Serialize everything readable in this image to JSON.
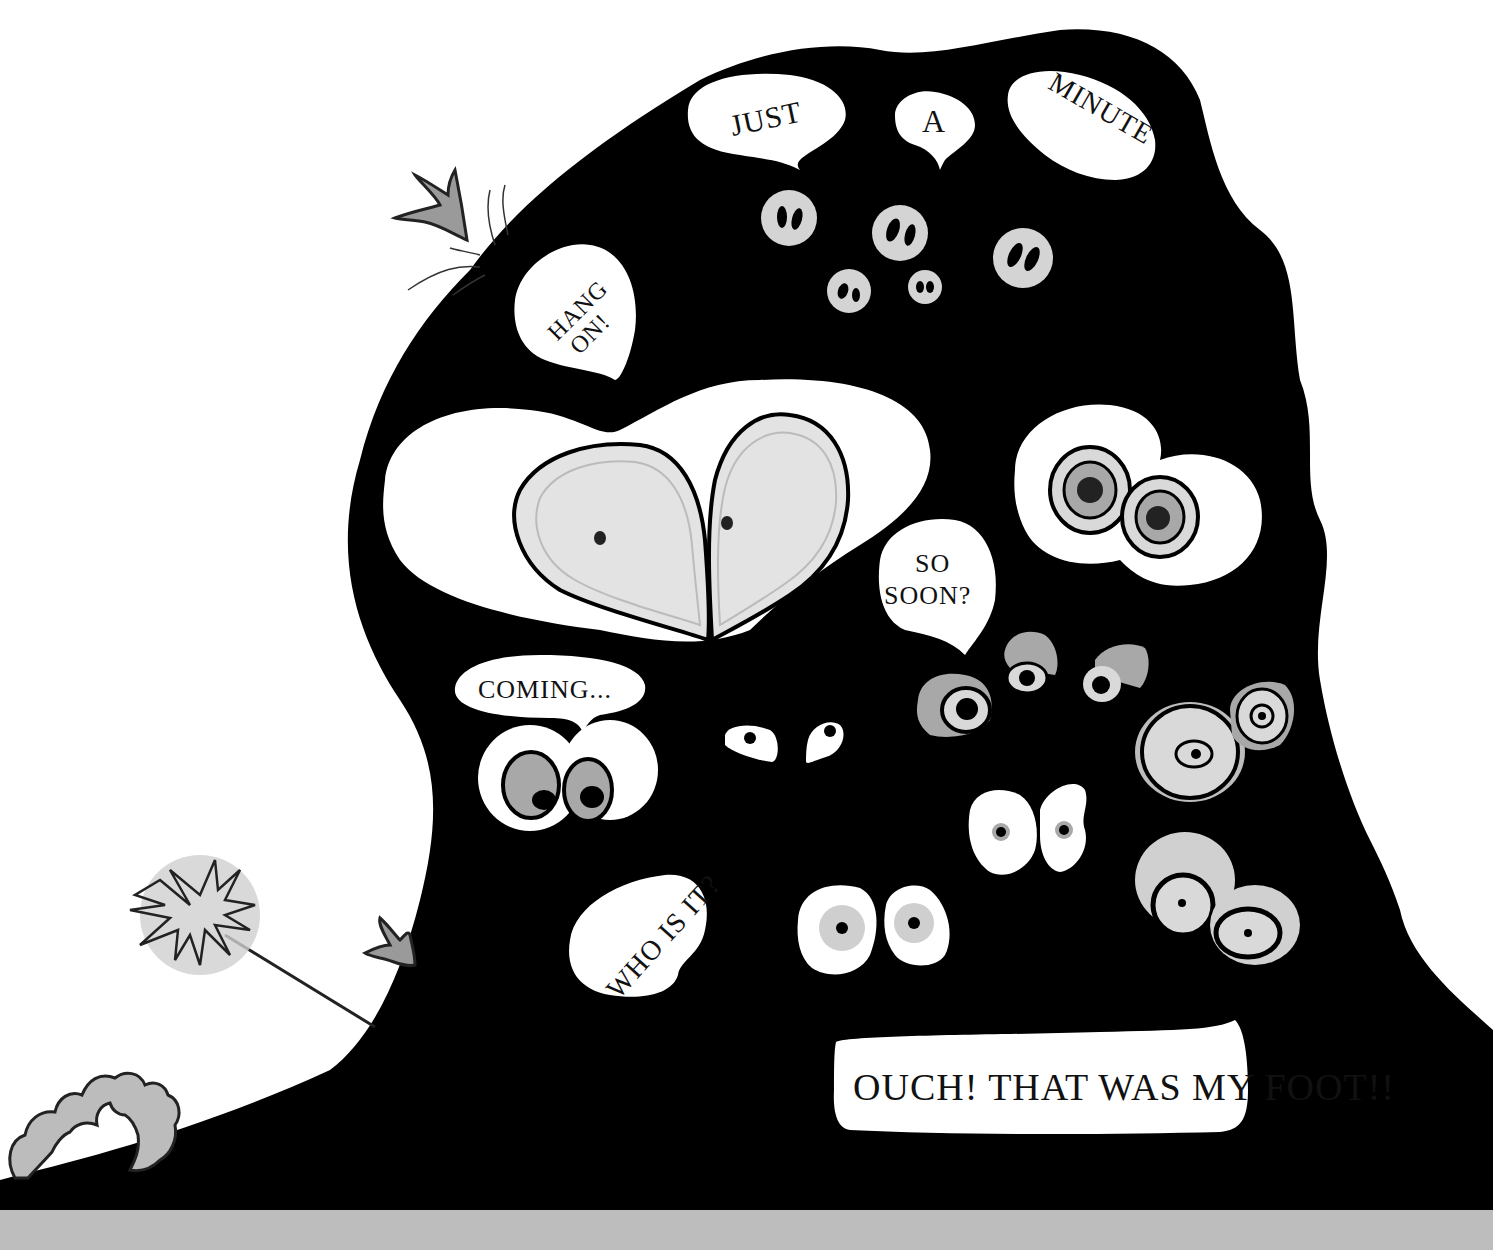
{
  "scene": {
    "description": "Black blob creature covered in many pairs of eyes and speech bubbles",
    "colors": {
      "background": "#ffffff",
      "creature": "#000000",
      "bubble": "#ffffff",
      "eye_light_gray": "#d9d9d9",
      "eye_mid_gray": "#a8a8a8",
      "eye_dark": "#2a2a2a",
      "ground_strip": "#bdbdbd",
      "plant_gray": "#9a9a9a"
    }
  },
  "speech_bubbles": {
    "just": "JUST",
    "a": "A",
    "minute": "MINUTE",
    "hang": "HANG",
    "on": "ON!",
    "so": "SO",
    "soon": "SOON?",
    "coming": "COMING...",
    "who_is_it": "WHO IS IT?",
    "ouch": "OUCH! THAT WAS MY FOOT!!"
  },
  "eyes": {
    "count_pairs": 13,
    "groups": [
      "top small gray eyes (5)",
      "large heart-shaped eyes",
      "concentric ringed eyes right",
      "coming eyes",
      "small white slit eyes",
      "gray lidded eyes",
      "ringed eyes lower right",
      "white oval eyes",
      "spiral ringed eyes bottom right",
      "oval eyes near who is it"
    ]
  },
  "props": {
    "left_flower": "spiky dandelion on stick",
    "left_claw_top": "gray claw",
    "left_claw_bottom": "gray claw",
    "ground_plant": "wavy gray leafy plant"
  }
}
